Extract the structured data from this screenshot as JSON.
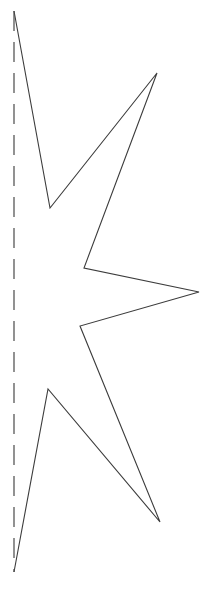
{
  "figure": {
    "name": "half-star-outline-with-fold-line",
    "canvas": {
      "width": 203,
      "height": 604,
      "background_color": "#ffffff"
    },
    "outline": {
      "name": "star-half-outline",
      "stroke_color": "#3c3c3c",
      "stroke_width": 1.1,
      "fill": "none",
      "points": "14,11 50,208 157,73 84,268 199,292 80,326 160,522 48,389 14,572",
      "vertices": [
        {
          "label": "top-point",
          "x": 14,
          "y": 11,
          "kind": "convex-on-axis"
        },
        {
          "label": "upper-left-notch",
          "x": 50,
          "y": 208,
          "kind": "concave"
        },
        {
          "label": "upper-right-point",
          "x": 157,
          "y": 73,
          "kind": "convex"
        },
        {
          "label": "upper-middle-notch",
          "x": 84,
          "y": 268,
          "kind": "concave"
        },
        {
          "label": "right-point",
          "x": 199,
          "y": 292,
          "kind": "convex"
        },
        {
          "label": "lower-middle-notch",
          "x": 80,
          "y": 326,
          "kind": "concave"
        },
        {
          "label": "lower-right-point",
          "x": 160,
          "y": 522,
          "kind": "convex"
        },
        {
          "label": "lower-left-notch",
          "x": 48,
          "y": 389,
          "kind": "concave"
        },
        {
          "label": "bottom-point",
          "x": 14,
          "y": 572,
          "kind": "convex-on-axis"
        }
      ]
    },
    "fold_line": {
      "name": "axis-of-symmetry",
      "stroke_color": "#4a4a4a",
      "stroke_width": 1.2,
      "dash_pattern": "20 11",
      "x": 14,
      "y_start": 11,
      "y_end": 572
    }
  },
  "chart_data": {
    "type": "line",
    "title": "",
    "xlabel": "",
    "ylabel": "",
    "xlim": [
      0,
      203
    ],
    "ylim": [
      604,
      0
    ],
    "grid": false,
    "legend": null,
    "series": [
      {
        "name": "star-half-outline",
        "x": [
          14,
          50,
          157,
          84,
          199,
          80,
          160,
          48,
          14
        ],
        "y": [
          11,
          208,
          73,
          268,
          292,
          326,
          522,
          389,
          572
        ]
      },
      {
        "name": "axis-of-symmetry",
        "x": [
          14,
          14
        ],
        "y": [
          11,
          572
        ]
      }
    ]
  }
}
